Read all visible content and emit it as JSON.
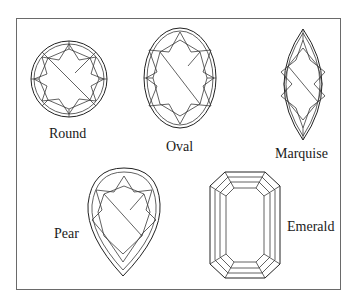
{
  "figure": {
    "shapes": [
      {
        "name": "Round",
        "label": "Round"
      },
      {
        "name": "Oval",
        "label": "Oval"
      },
      {
        "name": "Marquise",
        "label": "Marquise"
      },
      {
        "name": "Pear",
        "label": "Pear"
      },
      {
        "name": "Emerald",
        "label": "Emerald"
      }
    ]
  },
  "colors": {
    "line": "#3a3a3a",
    "frame": "#6a6a6a",
    "background": "#ffffff"
  }
}
